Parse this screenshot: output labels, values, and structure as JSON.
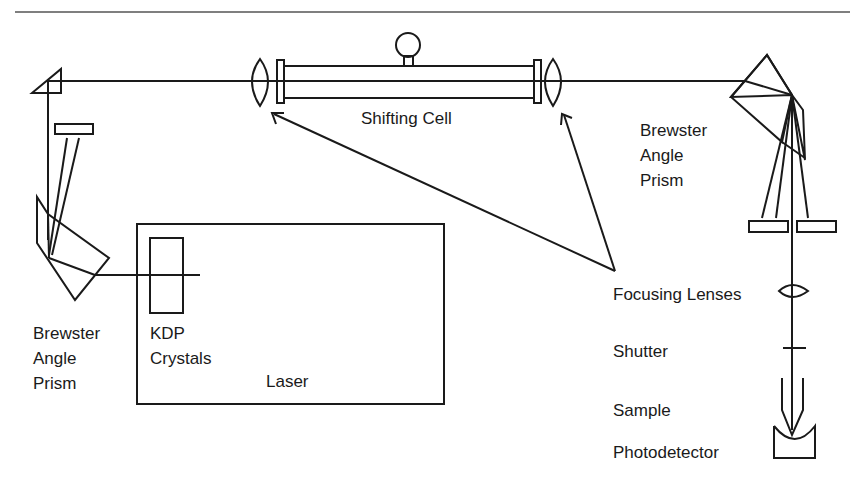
{
  "diagram": {
    "type": "optical-setup-schematic",
    "labels": {
      "shifting_cell": "Shifting Cell",
      "brewster_right": [
        "Brewster",
        "Angle",
        "Prism"
      ],
      "brewster_left": [
        "Brewster",
        "Angle",
        "Prism"
      ],
      "kdp": [
        "KDP",
        "Crystals"
      ],
      "laser": "Laser",
      "focusing_lenses": "Focusing Lenses",
      "shutter": "Shutter",
      "sample": "Sample",
      "photodetector": "Photodetector"
    },
    "colors": {
      "line": "#1a1a1a",
      "background": "#ffffff",
      "rule": "#555555"
    }
  }
}
